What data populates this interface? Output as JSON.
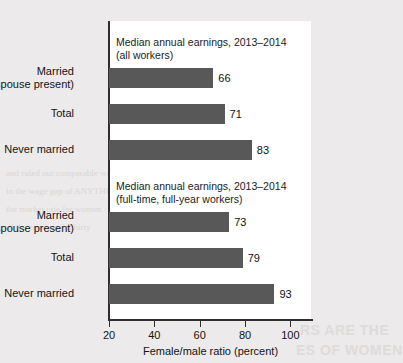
{
  "figure": {
    "bar_color": "#585858",
    "panel_color": "#ffffff",
    "page_color": "#eceaea",
    "axis_color": "#2e2e2e"
  },
  "chart_data": {
    "type": "bar",
    "orientation": "horizontal",
    "title": "",
    "xlabel": "Female/male ratio (percent)",
    "ylabel": "",
    "xlim": [
      20,
      110
    ],
    "xticks": [
      20,
      40,
      60,
      80,
      100
    ],
    "xticklabels": [
      "20",
      "40",
      "60",
      "80",
      "100"
    ],
    "grid": false,
    "legend": null,
    "groups": [
      {
        "annotation_line1": "Median annual earnings, 2013–2014",
        "annotation_line2": "(all workers)",
        "categories": [
          {
            "line1": "Married",
            "line2": "(spouse present)"
          },
          {
            "line1": "Total",
            "line2": ""
          },
          {
            "line1": "Never married",
            "line2": ""
          }
        ],
        "values": [
          66,
          71,
          83
        ],
        "value_labels": [
          "66",
          "71",
          "83"
        ]
      },
      {
        "annotation_line1": "Median annual earnings, 2013–2014",
        "annotation_line2": "(full-time, full-year workers)",
        "categories": [
          {
            "line1": "Married",
            "line2": "(spouse present)"
          },
          {
            "line1": "Total",
            "line2": ""
          },
          {
            "line1": "Never married",
            "line2": ""
          }
        ],
        "values": [
          73,
          79,
          93
        ],
        "value_labels": [
          "73",
          "79",
          "93"
        ]
      }
    ]
  },
  "bleed_text": {
    "l1": "and ruled out comparable worth",
    "l2": "in the wage gap of ANYTHING",
    "l3": "the market rate for women",
    "l4": "of the earnings in thirty",
    "b1": "RS ARE THE",
    "b2": "ES OF WOMEN"
  }
}
